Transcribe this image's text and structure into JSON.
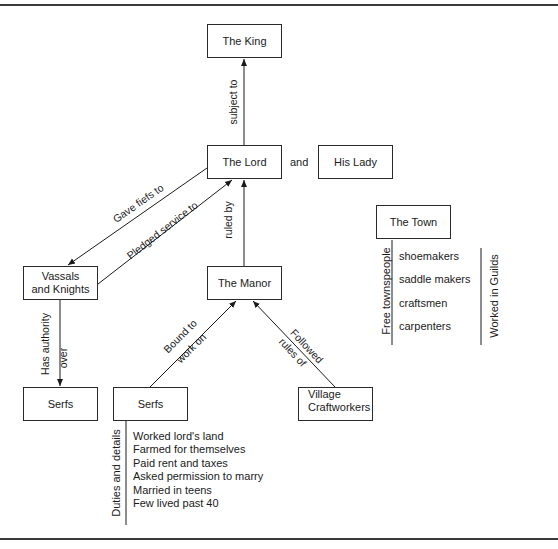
{
  "diagram": {
    "nodes": {
      "king": "The King",
      "lord": "The Lord",
      "lady": "His Lady",
      "vassals": "Vassals and Knights",
      "vassals_line1": "Vassals",
      "vassals_line2": "and Knights",
      "manor": "The Manor",
      "serfs_left": "Serfs",
      "serfs_right": "Serfs",
      "village_line1": "Village",
      "village_line2": "Craftworkers",
      "town": "The Town"
    },
    "connectors": {
      "and": "and",
      "subject_to": "subject to",
      "gave_fiefs_to": "Gave fiefs to",
      "pledged_service_to": "Pledged service to",
      "ruled_by": "ruled by",
      "has_authority": "Has authority",
      "over": "over",
      "bound_to": "Bound to",
      "work_on": "work on",
      "followed": "Followed",
      "rules_of": "rules of"
    },
    "serf_details": {
      "label": "Duties and details",
      "items": [
        "Worked lord's land",
        "Farmed for themselves",
        "Paid rent and taxes",
        "Asked permission to marry",
        "Married in teens",
        "Few lived past 40"
      ]
    },
    "town_details": {
      "label": "Free townspeople",
      "guild_label": "Worked in Guilds",
      "items": [
        "shoemakers",
        "saddle makers",
        "craftsmen",
        "carpenters"
      ]
    }
  }
}
